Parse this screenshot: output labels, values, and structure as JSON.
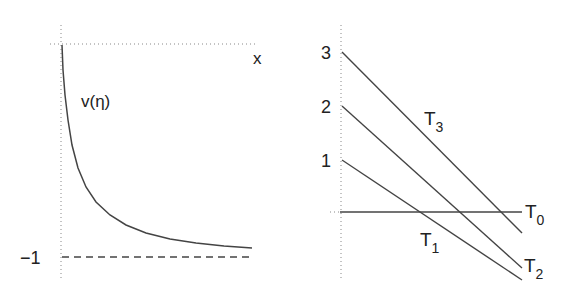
{
  "left_panel": {
    "x_axis_label": "x",
    "curve_label": "v(η)",
    "asymptote_label": "−1",
    "curve_points": [
      [
        62,
        45
      ],
      [
        63,
        70
      ],
      [
        65,
        95
      ],
      [
        68,
        120
      ],
      [
        72,
        145
      ],
      [
        78,
        168
      ],
      [
        86,
        187
      ],
      [
        96,
        202
      ],
      [
        110,
        215
      ],
      [
        126,
        225
      ],
      [
        146,
        233
      ],
      [
        170,
        239
      ],
      [
        196,
        243
      ],
      [
        224,
        246
      ],
      [
        252,
        248
      ]
    ]
  },
  "right_panel": {
    "tick_labels": [
      "3",
      "2",
      "1"
    ],
    "lines": [
      {
        "name": "T3",
        "main": "T",
        "sub": "3",
        "x1": 342,
        "y1": 52,
        "x2": 522,
        "y2": 233
      },
      {
        "name": "T2",
        "main": "T",
        "sub": "2",
        "x1": 342,
        "y1": 106,
        "x2": 522,
        "y2": 268
      },
      {
        "name": "T1",
        "main": "T",
        "sub": "1",
        "x1": 342,
        "y1": 160,
        "x2": 522,
        "y2": 280
      },
      {
        "name": "T0",
        "main": "T",
        "sub": "0",
        "x1": 340,
        "y1": 212,
        "x2": 522,
        "y2": 212
      }
    ]
  }
}
